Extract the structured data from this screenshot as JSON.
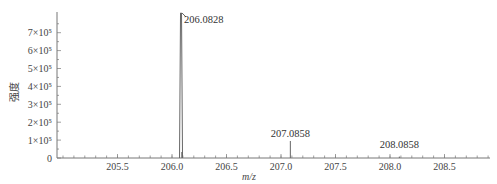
{
  "chart_data": {
    "type": "bar",
    "subtype": "mass-spectrum-stick",
    "title": "",
    "xlabel": "m/z",
    "ylabel": "强度",
    "xlim": [
      204.95,
      208.93
    ],
    "ylim": [
      0,
      800000
    ],
    "x_ticks": [
      205.5,
      206.0,
      206.5,
      207.0,
      207.5,
      208.0,
      208.5
    ],
    "x_tick_labels": [
      "205.5",
      "206.0",
      "206.5",
      "207.0",
      "207.5",
      "208.0",
      "208.5"
    ],
    "y_ticks": [
      0,
      100000,
      200000,
      300000,
      400000,
      500000,
      600000,
      700000
    ],
    "y_tick_labels": [
      "0",
      "1×10⁵",
      "2×10⁵",
      "3×10⁵",
      "4×10⁵",
      "5×10⁵",
      "6×10⁵",
      "7×10⁵"
    ],
    "grid": false,
    "legend": null,
    "series": [
      {
        "name": "spectrum",
        "x": [
          206.0828,
          207.0858,
          208.0858
        ],
        "values": [
          810000,
          95000,
          8000
        ]
      }
    ],
    "annotations": [
      {
        "text": "206.0828",
        "x": 206.0828
      },
      {
        "text": "207.0858",
        "x": 207.0858
      },
      {
        "text": "208.0858",
        "x": 208.0858
      }
    ]
  }
}
